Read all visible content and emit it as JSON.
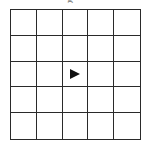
{
  "caption_fragment": "g",
  "grid": {
    "rows": 5,
    "cols": 5,
    "line_color": "#2a2a2a",
    "background": "#ffffff"
  },
  "marker": {
    "icon": "right-triangle-arrow-icon",
    "direction": "right",
    "row": 2,
    "col": 2,
    "color": "#111111"
  }
}
